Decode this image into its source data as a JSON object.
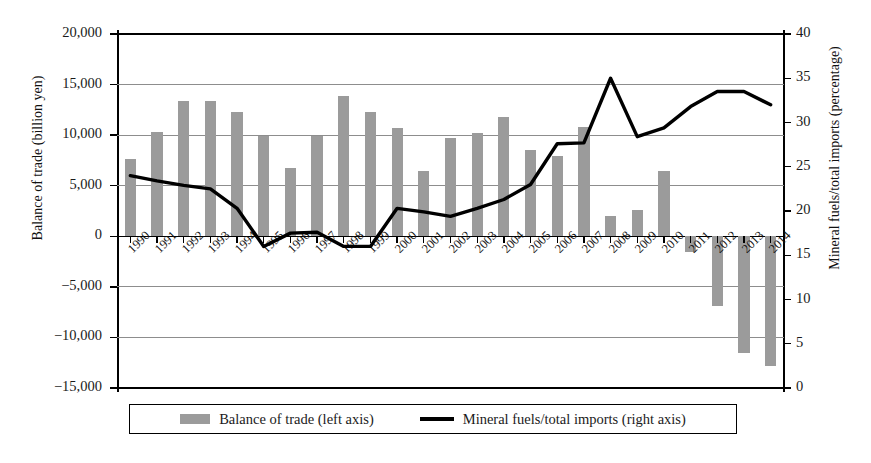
{
  "chart_data": {
    "type": "bar",
    "title": "",
    "xlabel": "",
    "categories": [
      "1990",
      "1991",
      "1992",
      "1993",
      "1994",
      "1995",
      "1996",
      "1997",
      "1998",
      "1999",
      "2000",
      "2001",
      "2002",
      "2003",
      "2004",
      "2005",
      "2006",
      "2007",
      "2008",
      "2009",
      "2010",
      "2011",
      "2012",
      "2013",
      "2014"
    ],
    "grid": true,
    "legend_position": "bottom",
    "series": [
      {
        "name": "Balance of trade (left axis)",
        "type": "bar",
        "axis": "left",
        "unit": "billion yen",
        "color": "#9b9b9b",
        "values": [
          7600,
          10300,
          13400,
          13400,
          12300,
          9900,
          6800,
          9900,
          13900,
          12300,
          10700,
          6500,
          9700,
          10200,
          11800,
          8500,
          7900,
          10800,
          2000,
          2600,
          6500,
          -1600,
          -6900,
          -11500,
          -12800
        ]
      },
      {
        "name": "Mineral fuels/total imports (right axis)",
        "type": "line",
        "axis": "right",
        "unit": "percentage",
        "color": "#000000",
        "values": [
          24.0,
          23.4,
          22.9,
          22.5,
          20.3,
          16.0,
          17.5,
          17.6,
          16.0,
          16.0,
          20.3,
          19.9,
          19.4,
          20.3,
          21.3,
          23.0,
          27.6,
          27.7,
          35.0,
          28.4,
          29.4,
          31.8,
          33.5,
          33.5,
          32.0
        ]
      }
    ],
    "left_axis": {
      "label": "Balance of trade (billion yen)",
      "ylim": [
        -15000,
        20000
      ],
      "ticks": [
        20000,
        15000,
        10000,
        5000,
        0,
        -5000,
        -10000,
        -15000
      ],
      "tick_labels": [
        "20,000",
        "15,000",
        "10,000",
        "5,000",
        "0",
        "−5,000",
        "−10,000",
        "−15,000"
      ]
    },
    "right_axis": {
      "label": "Mineral fuels/total imports (percentage)",
      "ylim": [
        0,
        40
      ],
      "ticks": [
        40,
        35,
        30,
        25,
        20,
        15,
        10,
        5,
        0
      ],
      "tick_labels": [
        "40",
        "35",
        "30",
        "25",
        "20",
        "15",
        "10",
        "5",
        "0"
      ]
    }
  },
  "legend": {
    "bar_label": "Balance of trade (left axis)",
    "line_label": "Mineral fuels/total imports (right axis)"
  }
}
